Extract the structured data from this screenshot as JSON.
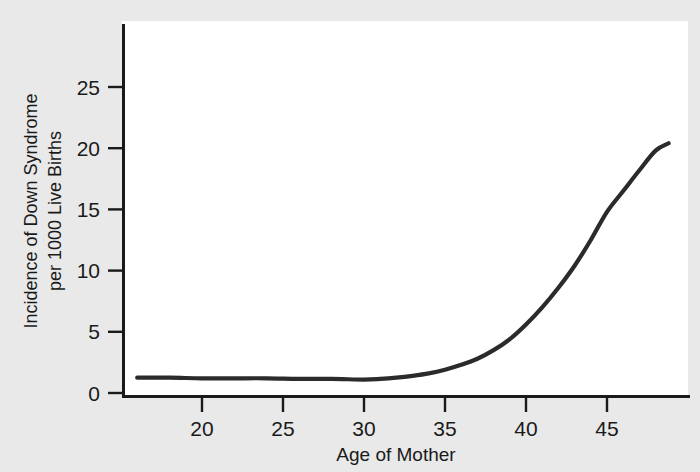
{
  "figure": {
    "background_color": "#e9e9e9",
    "plot_background_color": "#ffffff",
    "axis_color": "#1a1a1a",
    "curve_color": "#2b2b2b"
  },
  "chart_data": {
    "type": "line",
    "title": "",
    "subtitle": "",
    "xlabel": "Age of Mother",
    "ylabel": "Incidence of Down Syndrome per 1000 Live Births",
    "ylabel_line1": "Incidence of Down Syndrome",
    "ylabel_line2": "per 1000 Live Births",
    "xlim": [
      15.7,
      49.2
    ],
    "ylim": [
      0,
      30.2
    ],
    "xticks": [
      20,
      25,
      30,
      35,
      40,
      45
    ],
    "xtick_labels": [
      "20",
      "25",
      "30",
      "35",
      "40",
      "45"
    ],
    "yticks": [
      0,
      5,
      10,
      15,
      20,
      25
    ],
    "ytick_labels": [
      "0",
      "5",
      "10",
      "15",
      "20",
      "25"
    ],
    "grid": false,
    "legend": false,
    "legend_position": "none",
    "series": [
      {
        "name": "Incidence of Down Syndrome",
        "x": [
          16,
          18,
          20,
          22,
          24,
          26,
          28,
          30,
          31,
          32,
          33,
          34,
          35,
          36,
          37,
          38,
          39,
          40,
          41,
          42,
          43,
          44,
          45,
          46,
          47,
          48,
          48.8
        ],
        "values": [
          1.25,
          1.25,
          1.2,
          1.2,
          1.2,
          1.15,
          1.15,
          1.1,
          1.15,
          1.25,
          1.4,
          1.6,
          1.9,
          2.3,
          2.8,
          3.5,
          4.4,
          5.6,
          7.0,
          8.6,
          10.4,
          12.5,
          14.8,
          16.5,
          18.2,
          19.8,
          20.4
        ]
      }
    ]
  }
}
